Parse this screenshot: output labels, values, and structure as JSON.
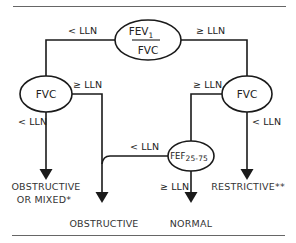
{
  "diagram": {
    "type": "decision-flowchart",
    "colors": {
      "line": "#1a1a1a",
      "text": "#222222",
      "rule": "#555555",
      "background": "#ffffff"
    },
    "nodes": {
      "root": {
        "label_top": "FEV",
        "label_top_sub": "1",
        "label_bottom": "FVC"
      },
      "left_fvc": {
        "label": "FVC"
      },
      "right_fvc": {
        "label": "FVC"
      },
      "fef": {
        "label": "FEF",
        "label_sub": "25-75"
      }
    },
    "edges": {
      "root_left": "< LLN",
      "root_right": "≥ LLN",
      "left_fvc_down": "< LLN",
      "left_fvc_right": "≥ LLN",
      "right_fvc_left": "≥ LLN",
      "right_fvc_down": "< LLN",
      "fef_left": "< LLN",
      "fef_down": "≥ LLN"
    },
    "outcomes": {
      "obstructive_or_mixed_line1": "OBSTRUCTIVE",
      "obstructive_or_mixed_line2": "OR MIXED*",
      "obstructive": "OBSTRUCTIVE",
      "normal": "NORMAL",
      "restrictive": "RESTRICTIVE**"
    }
  }
}
